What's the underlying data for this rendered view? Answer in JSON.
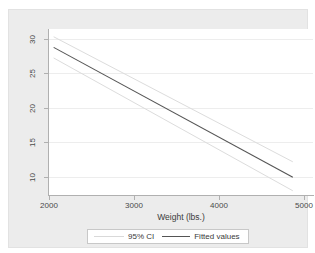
{
  "chart_data": {
    "type": "line",
    "title": "",
    "xlabel": "Weight (lbs.)",
    "ylabel": "",
    "xlim": [
      1700,
      5100
    ],
    "ylim": [
      8.0,
      31.5
    ],
    "xticks": [
      2000,
      3000,
      4000,
      5000
    ],
    "yticks": [
      10,
      15,
      20,
      25,
      30
    ],
    "xtick_labels": [
      "2000",
      "3000",
      "4000",
      "5000"
    ],
    "ytick_labels": [
      "10",
      "15",
      "20",
      "25",
      "30"
    ],
    "grid": "horizontal",
    "legend_position": "bottom-center",
    "series": [
      {
        "name": "Fitted values",
        "color": "#555555",
        "x": [
          1760,
          4840
        ],
        "values": [
          28.9,
          10.5
        ]
      },
      {
        "name": "95% CI upper",
        "color": "#dcdcdc",
        "x": [
          1760,
          4840
        ],
        "values": [
          30.4,
          12.7
        ]
      },
      {
        "name": "95% CI lower",
        "color": "#dcdcdc",
        "x": [
          1760,
          4840
        ],
        "values": [
          27.4,
          8.6
        ]
      }
    ],
    "legend": [
      {
        "label": "95% CI",
        "color": "#d9d9d9",
        "style": "line-light"
      },
      {
        "label": "Fitted values",
        "color": "#555555",
        "style": "line-dark"
      }
    ]
  },
  "colors": {
    "graph_region": "#ececec",
    "plot_background": "#ffffff",
    "gridline": "#ededed",
    "axis": "#b0b0b0",
    "fitted_line": "#555555",
    "ci_line": "#dcdcdc",
    "tick_text": "#4a4a4a"
  }
}
